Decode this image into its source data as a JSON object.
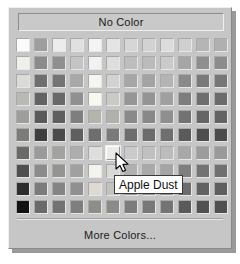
{
  "panel": {
    "name": "color-picker-popup",
    "background_color": "#c6c6c6"
  },
  "no_color": {
    "label": "No Color"
  },
  "more_colors": {
    "label": "More Colors..."
  },
  "tooltip": {
    "text": "Apple Dust",
    "visible": true
  },
  "cursor": {
    "icon": "arrow-pointer-icon",
    "x": 115,
    "y": 152
  },
  "grid": {
    "columns": 12,
    "rows": 10,
    "hovered_cell": {
      "row": 7,
      "column": 6,
      "name": "Apple Dust"
    },
    "colors": [
      [
        "#fbfbfb",
        "#9e9e9e",
        "#ececec",
        "#e0e0e0",
        "#f4f4f4",
        "#e4e4e4",
        "#d6d6d6",
        "#d2d2d2",
        "#dcdcdc",
        "#cfcfcf",
        "#b5b5b5",
        "#b0b0b0"
      ],
      [
        "#f0f0ea",
        "#8b8b8b",
        "#8f8f8f",
        "#c4c4c4",
        "#f2f2f2",
        "#dededb",
        "#bdbdbd",
        "#bbbbbb",
        "#cacaca",
        "#a6a6a6",
        "#8e8e8e",
        "#8c8c8c"
      ],
      [
        "#dadad6",
        "#6f6f6f",
        "#747474",
        "#a8a8a8",
        "#f6f6f0",
        "#d2d2d0",
        "#a6a6a6",
        "#a3a3a3",
        "#b4b4b4",
        "#8a8a8a",
        "#797979",
        "#767676"
      ],
      [
        "#b8b8b4",
        "#636363",
        "#686868",
        "#909090",
        "#f8f8ee",
        "#c9c9c6",
        "#969696",
        "#949494",
        "#a0a0a0",
        "#7d7d7d",
        "#6e6e6e",
        "#6b6b6b"
      ],
      [
        "#9e9e9c",
        "#5a5a5a",
        "#5f5f5f",
        "#7e7e7e",
        "#b4b4ac",
        "#b0b0ad",
        "#8a8a8a",
        "#888888",
        "#8f8f8f",
        "#727272",
        "#656565",
        "#636363"
      ],
      [
        "#7c7c7a",
        "#3f3f3f",
        "#4b4b4b",
        "#5f5f5f",
        "#6e6e6c",
        "#7a7a78",
        "#6d6d6d",
        "#6b6b6b",
        "#6f6f6f",
        "#5a5a5a",
        "#4e4e4e",
        "#4b4b4b"
      ],
      [
        "#6a6a68",
        "#9a9a98",
        "#a2a2a0",
        "#adadab",
        "#dededc",
        "#eceae6",
        "#cacaca",
        "#c0c0c0",
        "#bcbcbc",
        "#a8a8a8",
        "#9c9c9c",
        "#9a9a9a"
      ],
      [
        "#4f4f4f",
        "#8b8b8a",
        "#949492",
        "#a0a09e",
        "#f4f4ee",
        "#d8d8d4",
        "#b0b0b0",
        "#a9a9a9",
        "#a4a4a4",
        "#7f7f7f",
        "#737373",
        "#707070"
      ],
      [
        "#2e2e2e",
        "#7b7b7a",
        "#848482",
        "#90908e",
        "#dedad2",
        "#c2c2be",
        "#9a9a9a",
        "#949494",
        "#8f8f8f",
        "#6c6c6c",
        "#626262",
        "#5f5f5f"
      ],
      [
        "#121212",
        "#6a6a69",
        "#737371",
        "#7e7e7c",
        "#8e8e88",
        "#8a8a86",
        "#7c7c7c",
        "#787878",
        "#747474",
        "#5a5a5a",
        "#515151",
        "#4f4f4f"
      ]
    ]
  }
}
